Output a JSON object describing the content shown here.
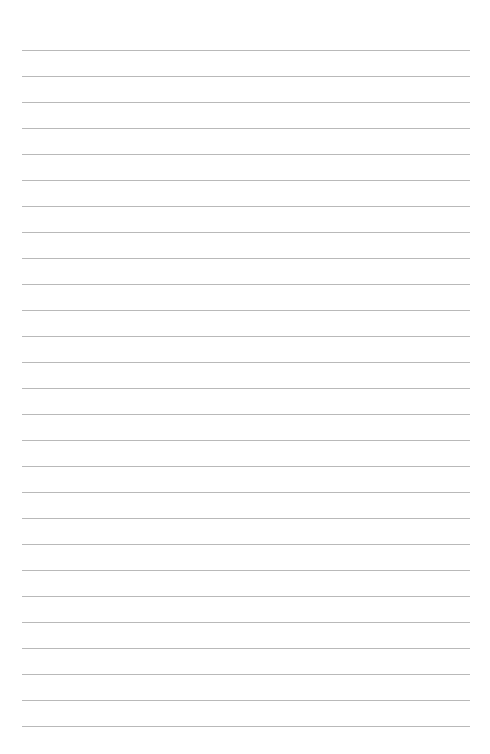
{
  "page": {
    "type": "lined-paper",
    "background_color": "#ffffff",
    "line_color": "#b9b9b9",
    "line_count": 27,
    "first_line_y": 50,
    "line_spacing": 26,
    "line_left": 22,
    "line_right": 470
  }
}
